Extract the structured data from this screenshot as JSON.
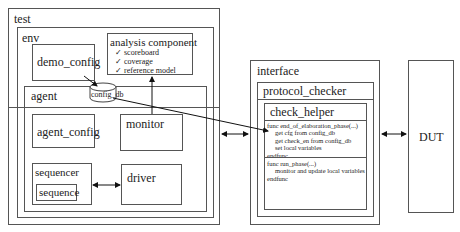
{
  "test": {
    "label": "test"
  },
  "env": {
    "label": "env"
  },
  "demo_config": {
    "label": "demo_config"
  },
  "analysis": {
    "title": "analysis component",
    "items": [
      "scoreboard",
      "coverage",
      "reference model"
    ],
    "check_glyph": "✓"
  },
  "config_db": {
    "label": "config_db"
  },
  "agent": {
    "label": "agent",
    "agent_config": "agent_config",
    "monitor": "monitor",
    "sequencer": "sequencer",
    "sequence": "sequence",
    "driver": "driver"
  },
  "interface": {
    "label": "interface",
    "protocol_checker": "protocol_checker",
    "check_helper": "check_helper",
    "func1": [
      "func end_of_elaboration_phase(...)",
      "    get cfg from config_db",
      "    get check_en from config_db",
      "    set local variables",
      "endfunc"
    ],
    "func2": [
      "func run_phase(...)",
      "    monitor and update local variables",
      "endfunc"
    ]
  },
  "dut": {
    "label": "DUT"
  }
}
